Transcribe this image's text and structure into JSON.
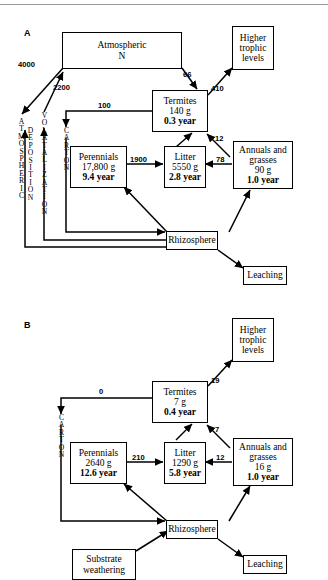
{
  "figure": {
    "panels": [
      {
        "id": "A",
        "label": "A",
        "boxes": {
          "atmospheric_n": {
            "lines": [
              "Atmospheric",
              "N"
            ]
          },
          "higher_trophic": {
            "lines": [
              "Higher",
              "trophic",
              "levels"
            ]
          },
          "termites": {
            "name": "Termites",
            "mass": "140 g",
            "turnover": "0.3 year"
          },
          "perennials": {
            "name": "Perennials",
            "mass": "17,800 g",
            "turnover": "9.4 year"
          },
          "litter": {
            "name": "Litter",
            "mass": "5550 g",
            "turnover": "2.8 year"
          },
          "annuals": {
            "lines": [
              "Annuals and",
              "grasses"
            ],
            "mass": "90 g",
            "turnover": "1.0 year"
          },
          "rhizosphere": {
            "name": "Rhizosphere"
          },
          "leaching": {
            "name": "Leaching"
          }
        },
        "pathway_labels": {
          "atmospheric_deposition": "ATMOSPHERIC DEPOSITION",
          "volatalization": "VOLATALIZATION",
          "carton": "CARTON"
        },
        "flows": {
          "deposition": "4000",
          "volatalization": "2200",
          "atmos_to_termites": "66",
          "termites_to_higher": "410",
          "termites_to_carton": "100",
          "annuals_to_termites": "12",
          "perennials_to_litter": "1900",
          "litter_from_annuals": "78"
        }
      },
      {
        "id": "B",
        "label": "B",
        "boxes": {
          "higher_trophic": {
            "lines": [
              "Higher",
              "trophic",
              "levels"
            ]
          },
          "termites": {
            "name": "Termites",
            "mass": "7 g",
            "turnover": "0.4 year"
          },
          "perennials": {
            "name": "Perennials",
            "mass": "2640 g",
            "turnover": "12.6 year"
          },
          "litter": {
            "name": "Litter",
            "mass": "1290 g",
            "turnover": "5.8 year"
          },
          "annuals": {
            "lines": [
              "Annuals and",
              "grasses"
            ],
            "mass": "16 g",
            "turnover": "1.0 year"
          },
          "rhizosphere": {
            "name": "Rhizosphere"
          },
          "substrate_weathering": {
            "lines": [
              "Substrate",
              "weathering"
            ]
          },
          "leaching": {
            "name": "Leaching"
          }
        },
        "pathway_labels": {
          "carton": "CARTON"
        },
        "flows": {
          "termites_to_carton": "0",
          "termites_to_higher": "19",
          "annuals_to_termites": "7",
          "perennials_to_litter": "210",
          "litter_from_annuals": "12"
        }
      }
    ]
  }
}
